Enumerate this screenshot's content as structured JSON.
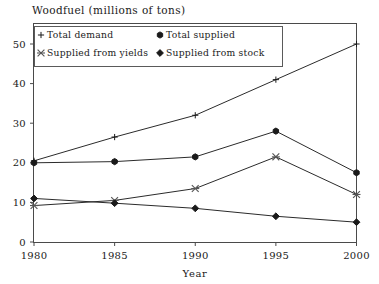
{
  "chart_data": {
    "type": "line",
    "title": "Woodfuel (millions of tons)",
    "xlabel": "Year",
    "ylabel": "",
    "x": [
      1980,
      1985,
      1990,
      1995,
      2000
    ],
    "xticklabels": [
      "1980",
      "1985",
      "1990",
      "1995",
      "2000"
    ],
    "yticklabels": [
      "0",
      "10",
      "20",
      "30",
      "40",
      "50"
    ],
    "yticks": [
      0,
      10,
      20,
      30,
      40,
      50
    ],
    "xlim": [
      1980,
      2000
    ],
    "ylim": [
      0,
      55
    ],
    "grid": false,
    "legend_position": "top-left-inside",
    "series": [
      {
        "name": "Total demand",
        "marker": "plus",
        "values": [
          20.5,
          26.5,
          32.0,
          41.0,
          50.0
        ]
      },
      {
        "name": "Total supplied",
        "marker": "hexagon",
        "values": [
          20.0,
          20.3,
          21.5,
          28.0,
          17.5
        ]
      },
      {
        "name": "Supplied from yields",
        "marker": "cross-x",
        "values": [
          9.2,
          10.5,
          13.5,
          21.5,
          12.0
        ]
      },
      {
        "name": "Supplied from stock",
        "marker": "diamond",
        "values": [
          11.0,
          9.8,
          8.5,
          6.5,
          5.0
        ]
      }
    ]
  },
  "legend": {
    "entries": [
      {
        "label": "Total demand",
        "marker_icon": "plus-marker-icon"
      },
      {
        "label": "Total supplied",
        "marker_icon": "hexagon-marker-icon"
      },
      {
        "label": "Supplied from yields",
        "marker_icon": "cross-marker-icon"
      },
      {
        "label": "Supplied from stock",
        "marker_icon": "diamond-marker-icon"
      }
    ]
  },
  "colors": {
    "line": "#2b2b2b",
    "marker": "#1a1a1a",
    "frame": "#4a4a4a",
    "text": "#1a1a1a",
    "background": "#ffffff"
  }
}
